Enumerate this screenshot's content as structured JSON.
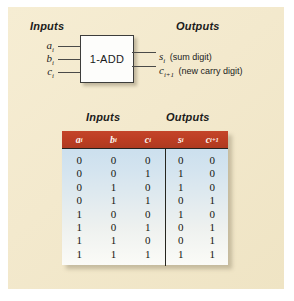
{
  "figure": {
    "diagram": {
      "inputs_heading": "Inputs",
      "outputs_heading": "Outputs",
      "block_label": "1-ADD",
      "input_labels": [
        {
          "name": "a",
          "sub": "i"
        },
        {
          "name": "b",
          "sub": "i"
        },
        {
          "name": "c",
          "sub": "i"
        }
      ],
      "output_labels": [
        {
          "name": "s",
          "sub": "i",
          "description": "(sum digit)"
        },
        {
          "name": "c",
          "sub": "i+1",
          "description": "(new carry digit)"
        }
      ]
    },
    "table": {
      "caption_inputs": "Inputs",
      "caption_outputs": "Outputs",
      "input_headers": [
        {
          "name": "a",
          "sub": "i"
        },
        {
          "name": "b",
          "sub": "i"
        },
        {
          "name": "c",
          "sub": "i"
        }
      ],
      "output_headers": [
        {
          "name": "s",
          "sub": "i"
        },
        {
          "name": "c",
          "sub": "i+1"
        }
      ],
      "columns": {
        "a_i": [
          "0",
          "0",
          "0",
          "0",
          "1",
          "1",
          "1",
          "1"
        ],
        "b_i": [
          "0",
          "0",
          "1",
          "1",
          "0",
          "0",
          "1",
          "1"
        ],
        "c_i": [
          "0",
          "1",
          "0",
          "1",
          "0",
          "1",
          "0",
          "1"
        ],
        "s_i": [
          "0",
          "1",
          "1",
          "0",
          "1",
          "0",
          "0",
          "1"
        ],
        "c_i1": [
          "0",
          "0",
          "0",
          "1",
          "0",
          "1",
          "1",
          "1"
        ]
      }
    },
    "colors": {
      "paper": "#f3e9cd",
      "header_red": "#bb3d22",
      "table_blue": "#c5dced",
      "ink": "#1b1b1b"
    }
  }
}
